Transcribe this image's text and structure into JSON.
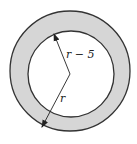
{
  "diagram": {
    "colors": {
      "ring_fill": "#d6d6d6",
      "stroke": "#333333",
      "inner_fill": "#ffffff"
    },
    "outer_circle": {
      "cx": 70,
      "cy": 71,
      "r": 60
    },
    "inner_circle": {
      "cx": 71,
      "cy": 74,
      "r": 43
    },
    "vertex": {
      "x": 70,
      "y": 74
    },
    "labels": {
      "inner_radius": "r − 5",
      "outer_radius": "r"
    }
  }
}
